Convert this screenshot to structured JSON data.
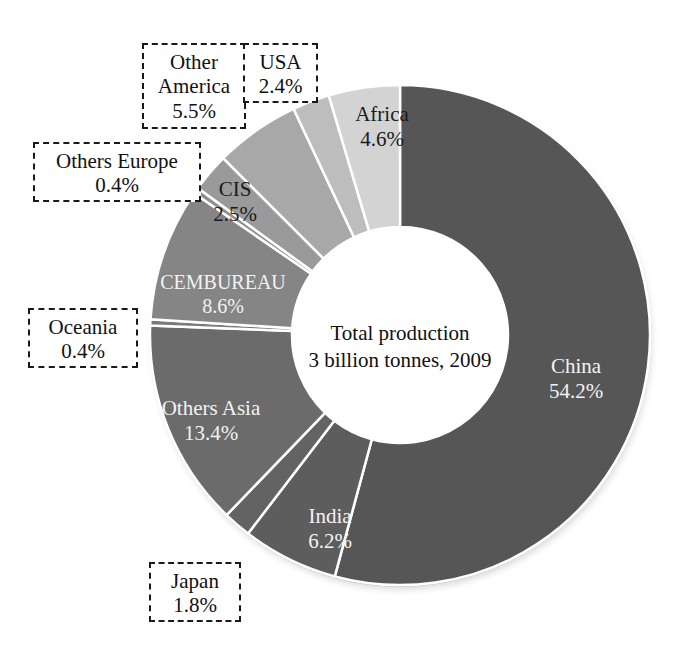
{
  "chart_data": {
    "type": "pie",
    "variant": "donut",
    "title": "",
    "center_label_line1": "Total production",
    "center_label_line2": "3 billion tonnes, 2009",
    "total_label": "3 billion tonnes",
    "year": "2009",
    "unit": "%",
    "start_angle_deg": 0,
    "direction": "clockwise",
    "inner_radius_ratio": 0.43,
    "categories": [
      "China",
      "India",
      "Japan",
      "Others Asia",
      "Oceania",
      "CEMBUREAU",
      "Others Europe",
      "CIS",
      "Other America",
      "USA",
      "Africa"
    ],
    "values": [
      54.2,
      6.2,
      1.8,
      13.4,
      0.4,
      8.6,
      0.4,
      2.5,
      5.5,
      2.4,
      4.6
    ],
    "slices": [
      {
        "label": "China",
        "value": 54.2,
        "value_text": "54.2%",
        "color": "#565656",
        "label_placement": "inside",
        "label_color": "light"
      },
      {
        "label": "India",
        "value": 6.2,
        "value_text": "6.2%",
        "color": "#5d5d5d",
        "label_placement": "inside",
        "label_color": "light"
      },
      {
        "label": "Japan",
        "value": 1.8,
        "value_text": "1.8%",
        "color": "#636363",
        "label_placement": "callout",
        "label_color": "dark"
      },
      {
        "label": "Others Asia",
        "value": 13.4,
        "value_text": "13.4%",
        "color": "#6b6b6b",
        "label_placement": "inside",
        "label_color": "light"
      },
      {
        "label": "Oceania",
        "value": 0.4,
        "value_text": "0.4%",
        "color": "#7a7a7a",
        "label_placement": "callout",
        "label_color": "dark"
      },
      {
        "label": "CEMBUREAU",
        "value": 8.6,
        "value_text": "8.6%",
        "color": "#858585",
        "label_placement": "inside",
        "label_color": "light"
      },
      {
        "label": "Others Europe",
        "value": 0.4,
        "value_text": "0.4%",
        "color": "#8f8f8f",
        "label_placement": "callout",
        "label_color": "dark"
      },
      {
        "label": "CIS",
        "value": 2.5,
        "value_text": "2.5%",
        "color": "#9a9a9a",
        "label_placement": "inside",
        "label_color": "dark"
      },
      {
        "label": "Other America",
        "value": 5.5,
        "value_text": "5.5%",
        "color": "#a8a8a8",
        "label_placement": "callout",
        "label_color": "dark"
      },
      {
        "label": "USA",
        "value": 2.4,
        "value_text": "2.4%",
        "color": "#bdbdbd",
        "label_placement": "callout",
        "label_color": "dark"
      },
      {
        "label": "Africa",
        "value": 4.6,
        "value_text": "4.6%",
        "color": "#d3d3d3",
        "label_placement": "inside",
        "label_color": "dark"
      }
    ],
    "legend": "none",
    "grid": false,
    "xlabel": "",
    "ylabel": ""
  },
  "callouts": {
    "other_america": {
      "name_line1": "Other",
      "name_line2": "America",
      "value": "5.5%"
    },
    "usa": {
      "name_line1": "USA",
      "value": "2.4%"
    },
    "others_europe": {
      "name_line1": "Others Europe",
      "value": "0.4%"
    },
    "oceania": {
      "name_line1": "Oceania",
      "value": "0.4%"
    },
    "japan": {
      "name_line1": "Japan",
      "value": "1.8%"
    }
  },
  "inside_labels": {
    "china": {
      "name": "China",
      "value": "54.2%"
    },
    "africa": {
      "name": "Africa",
      "value": "4.6%"
    },
    "cis": {
      "name": "CIS",
      "value": "2.5%"
    },
    "cembureau": {
      "name": "CEMBUREAU",
      "value": "8.6%"
    },
    "others_asia": {
      "name": "Others Asia",
      "value": "13.4%"
    },
    "india": {
      "name": "India",
      "value": "6.2%"
    }
  },
  "center": {
    "line1": "Total production",
    "line2": "3 billion tonnes, 2009"
  },
  "colors": {
    "background": "#ffffff",
    "text": "#111111",
    "label_light": "#f2f2f2",
    "slice_border": "#ffffff",
    "callout_border": "#1a1a1a"
  }
}
